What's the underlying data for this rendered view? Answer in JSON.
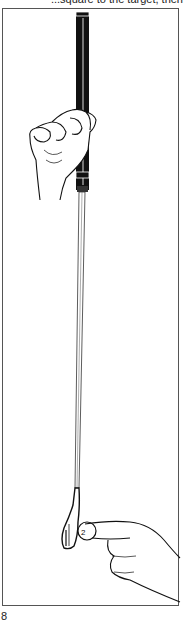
{
  "page": {
    "caption_top": "...square to the target, then",
    "figure_number": "8"
  },
  "illustration": {
    "subject": "golf club held vertically by a hand at the grip, with a hand placing a coin beside the clubhead",
    "elements": [
      "club-grip",
      "club-shaft",
      "club-head",
      "gripping-hand",
      "coin",
      "pointing-hand"
    ],
    "colors": {
      "ink": "#111111",
      "paper": "#ffffff",
      "frame": "#555555"
    }
  }
}
